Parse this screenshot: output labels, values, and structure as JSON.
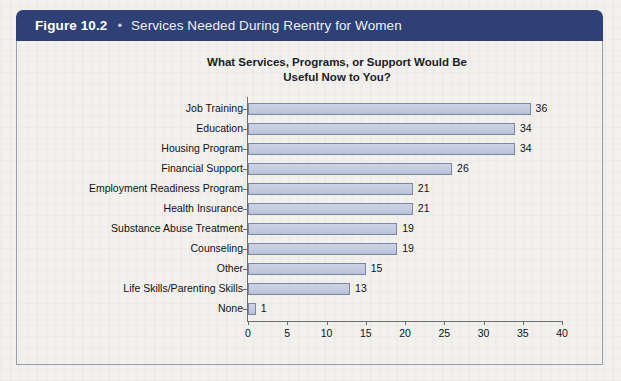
{
  "figure": {
    "number": "Figure 10.2",
    "bullet": "•",
    "title": "Services Needed During Reentry for Women",
    "header_color": "#2e4076",
    "header_text_color": "#eef0f7"
  },
  "chart_data": {
    "type": "bar",
    "orientation": "horizontal",
    "title": "What Services, Programs, or Support Would Be Useful Now to You?",
    "title_line1": "What Services, Programs, or Support Would Be",
    "title_line2": "Useful Now to You?",
    "categories": [
      "Job Training",
      "Education",
      "Housing Program",
      "Financial Support",
      "Employment Readiness Program",
      "Health Insurance",
      "Substance Abuse Treatment",
      "Counseling",
      "Other",
      "Life Skills/Parenting Skills",
      "None"
    ],
    "values": [
      36,
      34,
      34,
      26,
      21,
      21,
      19,
      19,
      15,
      13,
      1
    ],
    "xlabel": "",
    "ylabel": "",
    "xlim": [
      0,
      40
    ],
    "xticks": [
      0,
      5,
      10,
      15,
      20,
      25,
      30,
      35,
      40
    ],
    "xtick_labels": [
      "0",
      "5",
      "10",
      "15",
      "20",
      "25",
      "30",
      "35",
      "40"
    ],
    "grid": false,
    "legend": false,
    "bar_fill": "#c5ccdf",
    "bar_border": "#7d87a5"
  }
}
